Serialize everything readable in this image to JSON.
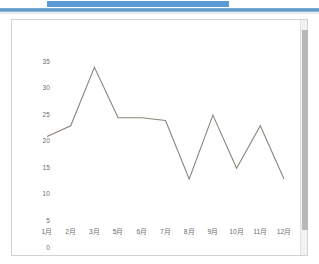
{
  "topbar": {
    "tab_chip_label": "",
    "accent_color": "#5b9bd5",
    "rule_color": "#5b93c4"
  },
  "chart_panel": {
    "border_color": "#d2d2d2",
    "background_color": "#ffffff",
    "scrollbar_track_color": "#f2f2f2",
    "scrollbar_thumb_color": "#b8b8b8"
  },
  "chart_data": {
    "type": "line",
    "title": "",
    "subtitle": "",
    "xlabel": "",
    "ylabel": "",
    "categories": [
      "1月",
      "2月",
      "3月",
      "5月",
      "6月",
      "7月",
      "8月",
      "9月",
      "10月",
      "11月",
      "12月"
    ],
    "values": [
      21,
      23,
      34,
      24.5,
      24.5,
      24,
      13,
      25,
      15,
      23,
      13
    ],
    "series": [
      {
        "name": "",
        "values": [
          21,
          23,
          34,
          24.5,
          24.5,
          24,
          13,
          25,
          15,
          23,
          13
        ],
        "color": "#8c847a"
      }
    ],
    "ylim": [
      0,
      35
    ],
    "yticks": [
      0,
      5,
      10,
      15,
      20,
      25,
      30,
      35
    ],
    "ytick_labels": [
      "0",
      "5",
      "10",
      "15",
      "20",
      "25",
      "30",
      "35"
    ],
    "grid": false,
    "legend": false,
    "legend_position": "none",
    "line_color": "#8c847a",
    "line_width": 1,
    "markers": false,
    "axis_line_color": "#ffffff",
    "tick_label_color": "#6b6b6b"
  }
}
